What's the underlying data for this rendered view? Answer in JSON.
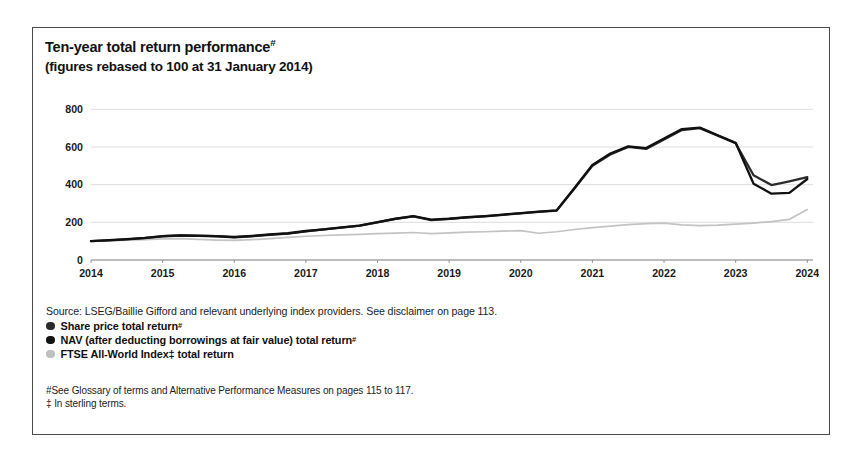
{
  "figure": {
    "title": "Ten-year total return performance",
    "title_superscript": "#",
    "subtitle": "(figures rebased to 100 at 31 January 2014)",
    "source": "Source: LSEG/Baillie Gifford and relevant underlying index providers. See disclaimer on page 113.",
    "legend": [
      {
        "label": "Share price total return",
        "superscript": "#",
        "color": "#2b2b2b"
      },
      {
        "label": "NAV (after deducting borrowings at fair value) total return",
        "superscript": "#",
        "color": "#111111"
      },
      {
        "label": "FTSE All-World Index‡ total return",
        "superscript": "",
        "color": "#c0c0c0"
      }
    ],
    "footnotes": [
      "#See Glossary of terms and Alternative Performance Measures on pages 115 to 117.",
      "‡ In sterling terms."
    ]
  },
  "chart_data": {
    "type": "line",
    "title": "Ten-year total return performance",
    "subtitle": "(figures rebased to 100 at 31 January 2014)",
    "xlabel": "",
    "ylabel": "",
    "xlim": [
      2014,
      2024.08
    ],
    "ylim": [
      0,
      860
    ],
    "yticks": [
      0,
      200,
      400,
      600,
      800
    ],
    "ytick_labels": [
      "0",
      "200",
      "400",
      "600",
      "800"
    ],
    "xticks": [
      2014,
      2015,
      2016,
      2017,
      2018,
      2019,
      2020,
      2021,
      2022,
      2023,
      2024
    ],
    "xtick_labels": [
      "2014",
      "2015",
      "2016",
      "2017",
      "2018",
      "2019",
      "2020",
      "2021",
      "2022",
      "2023",
      "2024"
    ],
    "grid": "horizontal",
    "legend_position": "below-chart",
    "x": [
      2014.0,
      2014.25,
      2014.5,
      2014.75,
      2015.0,
      2015.25,
      2015.5,
      2015.75,
      2016.0,
      2016.25,
      2016.5,
      2016.75,
      2017.0,
      2017.25,
      2017.5,
      2017.75,
      2018.0,
      2018.25,
      2018.5,
      2018.75,
      2019.0,
      2019.25,
      2019.5,
      2019.75,
      2020.0,
      2020.25,
      2020.5,
      2020.75,
      2021.0,
      2021.25,
      2021.5,
      2021.75,
      2022.0,
      2022.25,
      2022.5,
      2022.75,
      2023.0,
      2023.25,
      2023.5,
      2023.75,
      2024.0
    ],
    "series": [
      {
        "name": "Share price total return",
        "color": "#2b2b2b",
        "values": [
          100,
          104,
          110,
          116,
          126,
          130,
          128,
          126,
          120,
          126,
          134,
          140,
          152,
          162,
          172,
          182,
          200,
          218,
          232,
          212,
          218,
          226,
          232,
          240,
          248,
          256,
          262,
          380,
          500,
          560,
          600,
          590,
          640,
          690,
          700,
          660,
          620,
          450,
          398,
          418,
          440
        ]
      },
      {
        "name": "NAV (after deducting borrowings at fair value) total return",
        "color": "#111111",
        "values": [
          100,
          105,
          111,
          117,
          127,
          131,
          129,
          127,
          122,
          128,
          136,
          142,
          154,
          163,
          173,
          183,
          201,
          219,
          233,
          214,
          219,
          227,
          233,
          241,
          249,
          257,
          263,
          382,
          505,
          565,
          603,
          594,
          645,
          695,
          703,
          662,
          622,
          405,
          352,
          356,
          430
        ]
      },
      {
        "name": "FTSE All-World Index‡ total return",
        "color": "#c3c3c3",
        "values": [
          100,
          102,
          105,
          108,
          112,
          114,
          110,
          106,
          104,
          108,
          114,
          120,
          126,
          130,
          133,
          136,
          140,
          143,
          146,
          140,
          144,
          148,
          150,
          153,
          156,
          142,
          150,
          162,
          172,
          180,
          188,
          193,
          196,
          186,
          183,
          185,
          190,
          196,
          204,
          216,
          268
        ]
      }
    ]
  }
}
